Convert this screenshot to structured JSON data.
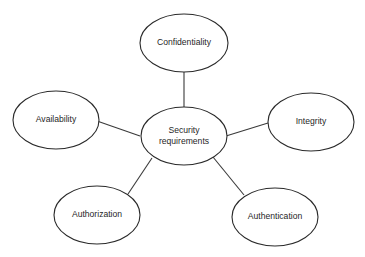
{
  "diagram": {
    "type": "mind-map",
    "colors": {
      "background": "#ffffff",
      "stroke": "#2a2a2a",
      "text": "#1f1f1f"
    },
    "center": {
      "id": "security-requirements",
      "label_line1": "Security",
      "label_line2": "requirements"
    },
    "nodes": [
      {
        "id": "confidentiality",
        "label": "Confidentiality"
      },
      {
        "id": "integrity",
        "label": "Integrity"
      },
      {
        "id": "authentication",
        "label": "Authentication"
      },
      {
        "id": "authorization",
        "label": "Authorization"
      },
      {
        "id": "availability",
        "label": "Availability"
      }
    ],
    "edges": [
      {
        "from": "security-requirements",
        "to": "confidentiality"
      },
      {
        "from": "security-requirements",
        "to": "integrity"
      },
      {
        "from": "security-requirements",
        "to": "authentication"
      },
      {
        "from": "security-requirements",
        "to": "authorization"
      },
      {
        "from": "security-requirements",
        "to": "availability"
      }
    ]
  }
}
